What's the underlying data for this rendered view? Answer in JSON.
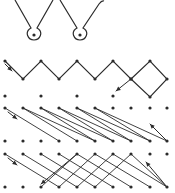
{
  "diagram": {
    "type": "stitch-path-diagram",
    "colors": {
      "ink": "#2b2b2b",
      "background": "#ffffff"
    },
    "columns_x": [
      5,
      23,
      41,
      59,
      77,
      95,
      113,
      131,
      150,
      167
    ],
    "section_loops": {
      "paths": [
        "M15,0 L31,28 C24,32 28,40 34,40 C40,40 44,32 37,28 L53,0",
        "M60,0 L77,28 C70,32 74,40 80,40 C86,40 90,32 83,28 L99,4 Q102,0 104,1"
      ],
      "centers": [
        [
          34,
          34
        ],
        [
          80,
          34
        ]
      ]
    },
    "section_zigzag": {
      "top_y": 61,
      "bottom_y": 79,
      "points": [
        [
          5,
          61
        ],
        [
          23,
          79
        ],
        [
          41,
          61
        ],
        [
          59,
          79
        ],
        [
          77,
          61
        ],
        [
          95,
          79
        ],
        [
          113,
          61
        ],
        [
          131,
          79
        ],
        [
          150,
          97
        ],
        [
          167,
          79
        ],
        [
          150,
          61
        ],
        [
          131,
          79
        ],
        [
          116,
          91
        ]
      ],
      "row_dots_y": 96,
      "row_dots_x": [
        5,
        41,
        77,
        113
      ]
    },
    "section_diagonals": {
      "top_y": 108,
      "bottom_y": 141,
      "lines": [
        [
          5,
          59
        ],
        [
          23,
          77
        ],
        [
          23,
          95
        ],
        [
          41,
          95
        ],
        [
          41,
          113
        ],
        [
          59,
          113
        ],
        [
          59,
          131
        ],
        [
          77,
          131
        ],
        [
          77,
          150
        ],
        [
          95,
          150
        ],
        [
          95,
          167
        ]
      ],
      "return_arrow": [
        [
          167,
          141
        ],
        [
          150,
          124
        ]
      ]
    },
    "section_cross": {
      "top_y": 154,
      "bottom_y": 187,
      "right_lines": [
        [
          5,
          59
        ],
        [
          23,
          77
        ],
        [
          41,
          95
        ],
        [
          59,
          113
        ],
        [
          77,
          131
        ],
        [
          95,
          150
        ],
        [
          113,
          167
        ],
        [
          131,
          167
        ]
      ],
      "left_lines": [
        [
          77,
          41
        ],
        [
          95,
          59
        ],
        [
          113,
          77
        ],
        [
          131,
          95
        ]
      ],
      "return_arrow": [
        [
          167,
          187
        ],
        [
          146,
          162
        ]
      ],
      "left_arrow_end": [
        41,
        184
      ]
    }
  }
}
